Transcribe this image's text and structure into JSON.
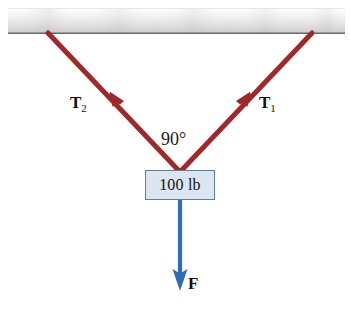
{
  "figure": {
    "support": {
      "name": "ceiling",
      "color_top": "#ffffff",
      "color_bottom": "#c9c9c9",
      "edge_color": "#6b6b6b"
    },
    "colors": {
      "cable_red": "#a02828",
      "force_blue": "#2e6db4",
      "box_fill": "#dce6f0",
      "box_border": "#5a7fa6",
      "text": "#111111"
    },
    "cables": [
      {
        "id": "T1",
        "label": "T",
        "subscript": "1",
        "side": "right",
        "from": [
          312,
          33
        ],
        "to": [
          180,
          172
        ],
        "arrow_at": [
          248,
          95
        ],
        "arrow_direction": "up-right"
      },
      {
        "id": "T2",
        "label": "T",
        "subscript": "2",
        "side": "left",
        "from": [
          48,
          33
        ],
        "to": [
          180,
          172
        ],
        "arrow_at": [
          112,
          95
        ],
        "arrow_direction": "up-left"
      }
    ],
    "angle": {
      "name": "cable-included-angle",
      "value": "90°"
    },
    "weight_box": {
      "label": "100 lb",
      "x": 145,
      "y": 170,
      "width": 70,
      "height": 30
    },
    "force": {
      "label": "F",
      "direction": "down",
      "from": [
        180,
        200
      ],
      "to": [
        180,
        290
      ],
      "color": "#2e6db4"
    }
  }
}
